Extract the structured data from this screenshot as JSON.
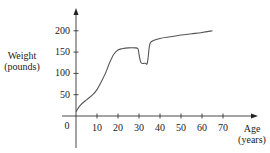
{
  "chart_data": {
    "type": "line",
    "title": "",
    "xlabel": "Age (years)",
    "ylabel": "Weight (pounds)",
    "xlabel_lines": [
      "Age",
      "(years)"
    ],
    "ylabel_lines": [
      "Weight",
      "(pounds)"
    ],
    "x_ticks": [
      10,
      20,
      30,
      40,
      50,
      60,
      70
    ],
    "y_ticks": [
      50,
      100,
      150,
      200
    ],
    "origin_label": "0",
    "xlim": [
      0,
      75
    ],
    "ylim": [
      0,
      230
    ],
    "grid": false,
    "legend": null,
    "series": [
      {
        "name": "Weight",
        "x": [
          0,
          2,
          5,
          8,
          10,
          12,
          14,
          16,
          18,
          20,
          22,
          25,
          28,
          29.5,
          30,
          31,
          33,
          34,
          35,
          36,
          40,
          45,
          50,
          55,
          60,
          65
        ],
        "y": [
          10,
          25,
          38,
          50,
          62,
          80,
          100,
          125,
          145,
          155,
          158,
          160,
          160,
          158,
          145,
          125,
          124,
          125,
          165,
          175,
          182,
          186,
          190,
          193,
          196,
          200
        ]
      }
    ]
  }
}
